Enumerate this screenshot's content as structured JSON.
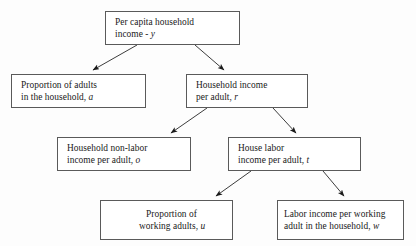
{
  "diagram": {
    "type": "tree",
    "background_color": "#fdfdfd",
    "box_border_color": "#5a5a5a",
    "box_fill_color": "#ffffff",
    "arrow_color": "#1a1a1a",
    "nodes": [
      {
        "id": "y",
        "line1": "Per capita household",
        "line2_prefix": "income - ",
        "variable": "y",
        "full_text": "Per capita household income - y",
        "level": 0
      },
      {
        "id": "a",
        "line1": "Proportion of adults",
        "line2_prefix": "in the household, ",
        "variable": "a",
        "full_text": "Proportion of adults in the household, a",
        "level": 1
      },
      {
        "id": "r",
        "line1": "Household income",
        "line2_prefix": "per adult, ",
        "variable": "r",
        "full_text": "Household income per adult, r",
        "level": 1
      },
      {
        "id": "o",
        "line1": "Household non-labor",
        "line2_prefix": "income per adult, ",
        "variable": "o",
        "full_text": "Household non-labor income per adult, o",
        "level": 2
      },
      {
        "id": "t",
        "line1": "House labor",
        "line2_prefix": "income per adult, ",
        "variable": "t",
        "full_text": "House labor income per adult, t",
        "level": 2
      },
      {
        "id": "u",
        "line1": "Proportion of",
        "line2_prefix": "working adults, ",
        "variable": "u",
        "full_text": "Proportion of working adults, u",
        "level": 3
      },
      {
        "id": "w",
        "line1": "Labor income per working",
        "line2_prefix": "adult in the household, ",
        "variable": "w",
        "full_text": "Labor income per working adult in the household, w",
        "level": 3
      }
    ],
    "edges": [
      {
        "from": "y",
        "to": "a",
        "direction": "down-left"
      },
      {
        "from": "y",
        "to": "r",
        "direction": "down-right"
      },
      {
        "from": "r",
        "to": "o",
        "direction": "down-left"
      },
      {
        "from": "r",
        "to": "t",
        "direction": "down-right"
      },
      {
        "from": "t",
        "to": "u",
        "direction": "down-left"
      },
      {
        "from": "t",
        "to": "w",
        "direction": "down-right"
      }
    ]
  }
}
